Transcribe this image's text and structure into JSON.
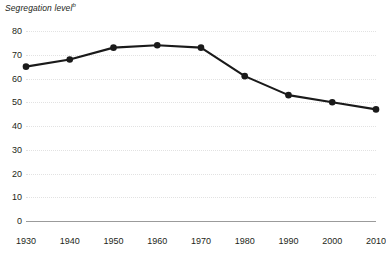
{
  "chart_data": {
    "type": "line",
    "title": "",
    "ylabel": "Segregation level",
    "ylabel_footnote": "b",
    "xlabel": "",
    "categories": [
      "1930",
      "1940",
      "1950",
      "1960",
      "1970",
      "1980",
      "1990",
      "2000",
      "2010"
    ],
    "x": [
      1930,
      1940,
      1950,
      1960,
      1970,
      1980,
      1990,
      2000,
      2010
    ],
    "values": [
      65,
      68,
      73,
      74,
      73,
      61,
      53,
      50,
      47
    ],
    "series": [
      {
        "name": "Segregation level",
        "values": [
          65,
          68,
          73,
          74,
          73,
          61,
          53,
          50,
          47
        ]
      }
    ],
    "ylim": [
      0,
      80
    ],
    "xlim": [
      1930,
      2010
    ],
    "y_ticks": [
      0,
      10,
      20,
      30,
      40,
      50,
      60,
      70,
      80
    ],
    "y_tick_labels": [
      "0",
      "10",
      "20",
      "30",
      "40",
      "50",
      "60",
      "70",
      "80"
    ],
    "x_tick_labels": [
      "1930",
      "1940",
      "1950",
      "1960",
      "1970",
      "1980",
      "1990",
      "2000",
      "2010"
    ],
    "grid": true,
    "grid_axis": "y",
    "grid_style": "dotted",
    "legend": false,
    "legend_position": "none",
    "line_color": "#1a1a1a",
    "marker": "circle",
    "marker_color": "#1a1a1a",
    "background_color": "#ffffff",
    "axis_line_color": "#9b9b9b",
    "gridline_color": "#e2e2e2",
    "text_color": "#231f20"
  }
}
